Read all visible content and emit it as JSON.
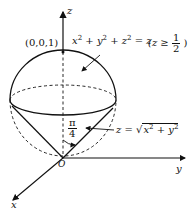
{
  "diagram": {
    "axes": {
      "z_label": "z",
      "y_label": "y",
      "x_label": "x",
      "origin_label": "O"
    },
    "point_label": "(0,0,1)",
    "sphere_equation": {
      "lhs_x": "x",
      "lhs_y": "y",
      "lhs_z": "z",
      "exp": "2",
      "plus": "+",
      "equals": "= z",
      "condition_prefix": "(z ≥",
      "condition_num": "1",
      "condition_den": "2",
      "condition_suffix": ")"
    },
    "cone_equation": {
      "prefix": "z = ",
      "radicand_x": "x",
      "radicand_y": "y",
      "exp": "2",
      "plus": " + "
    },
    "angle_label": {
      "num": "π",
      "den": "4"
    },
    "colors": {
      "stroke": "#111111",
      "background": "#ffffff"
    }
  }
}
